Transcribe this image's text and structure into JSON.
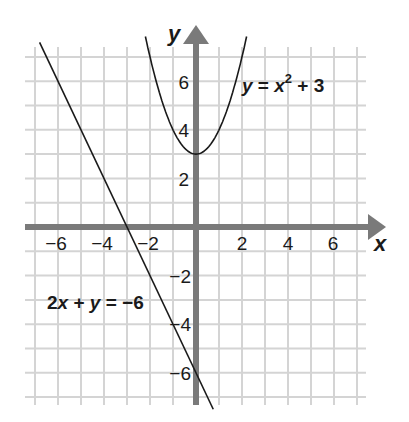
{
  "chart_data": {
    "type": "line",
    "title": "",
    "xlabel": "x",
    "ylabel": "y",
    "xlim": [
      -7,
      7
    ],
    "ylim": [
      -7,
      7
    ],
    "grid": true,
    "x_ticks": [
      -6,
      -4,
      -2,
      2,
      4,
      6
    ],
    "y_ticks": [
      6,
      4,
      2,
      -2,
      -4,
      -6
    ],
    "x_tick_labels": [
      "−6",
      "−4",
      "−2",
      "2",
      "4",
      "6"
    ],
    "y_tick_labels": [
      "6",
      "4",
      "2",
      "−2",
      "−4",
      "−6"
    ],
    "series": [
      {
        "name": "y = x² + 3",
        "equation": "y = x^2 + 3",
        "kind": "parabola",
        "vertex": [
          0,
          3
        ],
        "x": [
          -2.2,
          -2,
          -1.5,
          -1,
          -0.5,
          0,
          0.5,
          1,
          1.5,
          2,
          2.2
        ],
        "y": [
          7.84,
          7,
          5.25,
          4,
          3.25,
          3,
          3.25,
          4,
          5.25,
          7,
          7.84
        ]
      },
      {
        "name": "2x + y = −6",
        "equation": "2x + y = -6",
        "kind": "line",
        "x": [
          -6.8,
          0.75
        ],
        "y": [
          7.6,
          -7.5
        ],
        "x_intercept": -3,
        "y_intercept": -6
      }
    ],
    "annotations": [
      {
        "text_parts": [
          "y",
          " = ",
          "x",
          "2",
          " + 3"
        ],
        "label": "y = x² + 3",
        "position": [
          2.0,
          6.0
        ]
      },
      {
        "text_parts": [
          "2",
          "x",
          " + ",
          "y",
          " = −6"
        ],
        "label": "2x + y = −6",
        "position": [
          -6.4,
          -3.2
        ]
      }
    ]
  },
  "labels": {
    "x_axis": "x",
    "y_axis": "y",
    "parabola": {
      "y": "y",
      "eq": " = ",
      "x": "x",
      "exp": "2",
      "rest": " + 3"
    },
    "line": {
      "two": "2",
      "x": "x",
      "plus": " + ",
      "y": "y",
      "rest": " = −6"
    }
  },
  "ticks": {
    "x": [
      "−6",
      "−4",
      "−2",
      "2",
      "4",
      "6"
    ],
    "y": [
      "6",
      "4",
      "2",
      "−2",
      "−4",
      "−6"
    ]
  },
  "colors": {
    "grid": "#d4d4d4",
    "axis": "#7a7a7a",
    "curve": "#1a1a1a",
    "text": "#1a1a1a"
  }
}
